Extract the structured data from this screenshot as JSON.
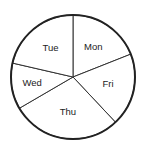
{
  "chart_data": {
    "type": "pie",
    "title": "",
    "categories": [
      "Mon",
      "Fri",
      "Thu",
      "Wed",
      "Tue"
    ],
    "values": [
      19,
      19,
      28.6,
      12,
      21.4
    ],
    "unit": "percent",
    "start_angle_deg": 0,
    "direction": "clockwise",
    "legend": "none",
    "labels_inside": true
  },
  "colors": {
    "slice_fill": "#ffffff",
    "stroke": "#222222",
    "text": "#222222"
  }
}
